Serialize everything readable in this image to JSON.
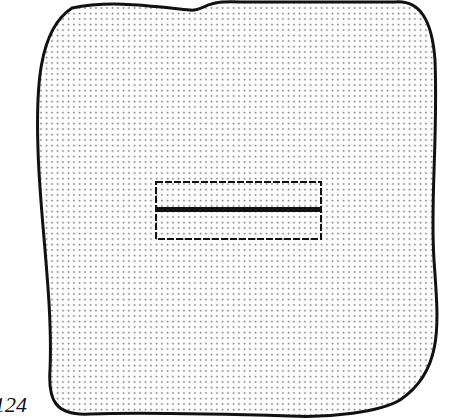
{
  "figure": {
    "label": "124",
    "shape": "irregular-rounded-square",
    "fill_pattern": "dot-stipple",
    "colors": {
      "outline": "#111111",
      "dots": "#7a7a7a",
      "background": "#ffffff"
    },
    "inner_element": {
      "shape": "rectangle",
      "border": "dashed",
      "divider": "solid-horizontal-line",
      "sections": 2
    }
  }
}
